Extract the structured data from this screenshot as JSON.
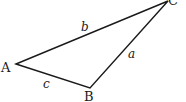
{
  "diagram": {
    "type": "triangle",
    "stroke_color": "#1a1a1a",
    "vertices": [
      {
        "id": "A",
        "label": "A",
        "x": 16,
        "y": 64
      },
      {
        "id": "B",
        "label": "B",
        "x": 90,
        "y": 88
      },
      {
        "id": "C",
        "label": "C",
        "x": 168,
        "y": 1
      }
    ],
    "sides": [
      {
        "id": "a",
        "label": "a",
        "from": "B",
        "to": "C"
      },
      {
        "id": "b",
        "label": "b",
        "from": "A",
        "to": "C"
      },
      {
        "id": "c",
        "label": "c",
        "from": "A",
        "to": "B"
      }
    ]
  }
}
